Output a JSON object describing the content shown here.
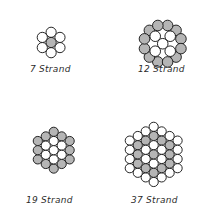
{
  "page": {
    "background_color": "#ffffff",
    "width": 211,
    "height": 222
  },
  "style": {
    "circle_fill_white": "#ffffff",
    "circle_fill_gray": "#b5b5b5",
    "circle_stroke": "#1a1a1a",
    "label_color": "#2b2b2b"
  },
  "figures": [
    {
      "id": "strand-7",
      "count": "7",
      "label_number": "7",
      "label_word": "Strand",
      "label_full": "7 Strand",
      "origin_x": 36,
      "origin_y": 26,
      "label_x": 30,
      "label_y": 64,
      "radius": 5.1,
      "spacing": 10.2,
      "rings": [
        {
          "ring": 0,
          "count": 1,
          "fill": "gray"
        },
        {
          "ring": 1,
          "count": 6,
          "fill": "white"
        }
      ]
    },
    {
      "id": "strand-12",
      "count": "12",
      "label_number": "12",
      "label_word": "Strand",
      "label_full": "12 Strand",
      "origin_x": 138,
      "origin_y": 19,
      "label_x": 138,
      "label_y": 64,
      "radius": 5.3,
      "spacing": 10.6,
      "rings": [
        {
          "ring": 0,
          "count": 5,
          "fill": "white"
        },
        {
          "ring": 1,
          "count": 12,
          "fill": "gray"
        }
      ]
    },
    {
      "id": "strand-19",
      "count": "19",
      "label_number": "19",
      "label_word": "Strand",
      "label_full": "19 Strand",
      "origin_x": 32,
      "origin_y": 126,
      "radius": 4.6,
      "spacing": 9.2,
      "label_x": 26,
      "label_y": 195,
      "rings": [
        {
          "ring": 0,
          "count": 1,
          "fill": "white"
        },
        {
          "ring": 1,
          "count": 6,
          "fill": "white"
        },
        {
          "ring": 2,
          "count": 12,
          "fill": "gray"
        }
      ]
    },
    {
      "id": "strand-37",
      "count": "37",
      "label_number": "37",
      "label_word": "Strand",
      "label_full": "37 Strand",
      "origin_x": 124,
      "origin_y": 121,
      "radius": 4.6,
      "spacing": 9.2,
      "label_x": 131,
      "label_y": 195,
      "rings": [
        {
          "ring": 0,
          "count": 1,
          "fill": "gray"
        },
        {
          "ring": 1,
          "count": 6,
          "fill": "white"
        },
        {
          "ring": 2,
          "count": 12,
          "fill": "gray"
        },
        {
          "ring": 3,
          "count": 18,
          "fill": "white"
        }
      ]
    }
  ]
}
